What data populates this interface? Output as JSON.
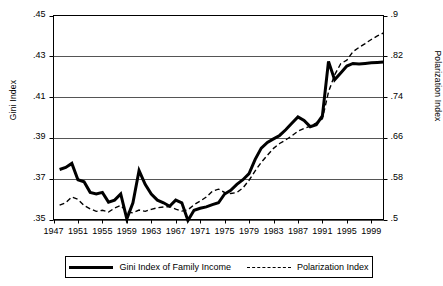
{
  "chart_data": {
    "type": "line",
    "title": "",
    "xlabel": "",
    "ylabel": "Gini Index",
    "y2label": "Polarization Index",
    "grid": true,
    "legend_position": "bottom",
    "xlim": [
      1947,
      2001
    ],
    "ylim": [
      0.35,
      0.45
    ],
    "y2lim": [
      0.5,
      0.9
    ],
    "xticks": [
      1947,
      1951,
      1955,
      1959,
      1963,
      1967,
      1971,
      1975,
      1979,
      1983,
      1987,
      1991,
      1995,
      1999
    ],
    "xtick_labels": [
      "1947",
      "1951",
      "1955",
      "1959",
      "1963",
      "1967",
      "1971",
      "1975",
      "1979",
      "1983",
      "1987",
      "1991",
      "1995",
      "1999"
    ],
    "yticks": [
      0.35,
      0.37,
      0.39,
      0.41,
      0.43,
      0.45
    ],
    "ytick_labels": [
      ".35",
      ".37",
      ".39",
      ".41",
      ".43",
      ".45"
    ],
    "y2ticks": [
      0.5,
      0.58,
      0.66,
      0.74,
      0.82,
      0.9
    ],
    "y2tick_labels": [
      ".5",
      ".58",
      ".66",
      ".74",
      ".82",
      ".9"
    ],
    "x": [
      1948,
      1949,
      1950,
      1951,
      1952,
      1953,
      1954,
      1955,
      1956,
      1957,
      1958,
      1959,
      1960,
      1961,
      1962,
      1963,
      1964,
      1965,
      1966,
      1967,
      1968,
      1969,
      1970,
      1971,
      1972,
      1973,
      1974,
      1975,
      1976,
      1977,
      1978,
      1979,
      1980,
      1981,
      1982,
      1983,
      1984,
      1985,
      1986,
      1987,
      1988,
      1989,
      1990,
      1991,
      1992,
      1993,
      1994,
      1995,
      1996,
      1997,
      1998,
      1999,
      2000,
      2001
    ],
    "series": [
      {
        "name": "Gini Index of Family Income",
        "axis": "left",
        "style": "solid",
        "width": 3,
        "color": "#000000",
        "values": [
          0.3745,
          0.3755,
          0.3775,
          0.3695,
          0.3685,
          0.3633,
          0.3625,
          0.3633,
          0.3585,
          0.3595,
          0.3625,
          0.3503,
          0.3582,
          0.374,
          0.3672,
          0.3625,
          0.3595,
          0.3582,
          0.3565,
          0.3595,
          0.3582,
          0.3495,
          0.3545,
          0.3555,
          0.3562,
          0.3573,
          0.3582,
          0.3625,
          0.3643,
          0.3672,
          0.3695,
          0.3725,
          0.3795,
          0.385,
          0.3878,
          0.3895,
          0.3912,
          0.394,
          0.3972,
          0.4003,
          0.3985,
          0.3955,
          0.3965,
          0.4008,
          0.4275,
          0.4185,
          0.4218,
          0.4252,
          0.4265,
          0.4262,
          0.4265,
          0.4268,
          0.427,
          0.4272
        ]
      },
      {
        "name": "Polarization Index",
        "axis": "right",
        "style": "dashed",
        "width": 1.4,
        "color": "#000000",
        "values": [
          0.528,
          0.533,
          0.544,
          0.5395,
          0.5275,
          0.521,
          0.516,
          0.518,
          0.5145,
          0.5225,
          0.5275,
          0.515,
          0.513,
          0.5185,
          0.516,
          0.52,
          0.523,
          0.5245,
          0.5255,
          0.5205,
          0.5165,
          0.519,
          0.529,
          0.536,
          0.544,
          0.5555,
          0.5595,
          0.553,
          0.551,
          0.553,
          0.562,
          0.577,
          0.5955,
          0.612,
          0.626,
          0.6395,
          0.649,
          0.656,
          0.664,
          0.673,
          0.6785,
          0.683,
          0.6895,
          0.6975,
          0.75,
          0.7835,
          0.8055,
          0.8125,
          0.829,
          0.8375,
          0.845,
          0.853,
          0.86,
          0.866
        ]
      }
    ]
  },
  "axes": {
    "left_title": "Gini Index",
    "right_title": "Polarization Index"
  },
  "legend": {
    "entries": [
      {
        "label": "Gini Index of Family Income",
        "marker": "solid-line-swatch"
      },
      {
        "label": "Polarization Index",
        "marker": "dashed-line-swatch"
      }
    ]
  },
  "colors": {
    "line": "#000000",
    "grid": "#555555",
    "frame": "#000000",
    "background": "#ffffff"
  }
}
